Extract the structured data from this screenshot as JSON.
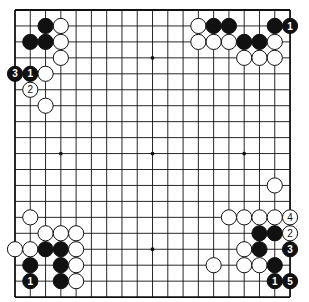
{
  "board": {
    "size": 19,
    "origin_x": 15,
    "origin_y": 10,
    "step_x": 15.28,
    "step_y": 15.95,
    "stone_radius": 7.6,
    "hoshi": [
      [
        9,
        3
      ],
      [
        3,
        9
      ],
      [
        9,
        9
      ],
      [
        15,
        9
      ],
      [
        9,
        15
      ]
    ],
    "colors": {
      "black": "#111111",
      "white": "#ffffff",
      "line": "#111111"
    }
  },
  "stones": [
    {
      "c": 2,
      "r": 1,
      "color": "black"
    },
    {
      "c": 3,
      "r": 1,
      "color": "white"
    },
    {
      "c": 1,
      "r": 2,
      "color": "black"
    },
    {
      "c": 2,
      "r": 2,
      "color": "black"
    },
    {
      "c": 3,
      "r": 2,
      "color": "white"
    },
    {
      "c": 3,
      "r": 3,
      "color": "white"
    },
    {
      "c": 0,
      "r": 4,
      "color": "black",
      "label": "3"
    },
    {
      "c": 1,
      "r": 4,
      "color": "black",
      "label": "1"
    },
    {
      "c": 2,
      "r": 4,
      "color": "white"
    },
    {
      "c": 1,
      "r": 5,
      "color": "white",
      "label": "2"
    },
    {
      "c": 2,
      "r": 6,
      "color": "white"
    },
    {
      "c": 12,
      "r": 1,
      "color": "white"
    },
    {
      "c": 13,
      "r": 1,
      "color": "black"
    },
    {
      "c": 14,
      "r": 1,
      "color": "black"
    },
    {
      "c": 17,
      "r": 1,
      "color": "black"
    },
    {
      "c": 18,
      "r": 1,
      "color": "black",
      "label": "1"
    },
    {
      "c": 12,
      "r": 2,
      "color": "white"
    },
    {
      "c": 13,
      "r": 2,
      "color": "white"
    },
    {
      "c": 14,
      "r": 2,
      "color": "white"
    },
    {
      "c": 15,
      "r": 2,
      "color": "black"
    },
    {
      "c": 16,
      "r": 2,
      "color": "black"
    },
    {
      "c": 17,
      "r": 2,
      "color": "white"
    },
    {
      "c": 15,
      "r": 3,
      "color": "white"
    },
    {
      "c": 16,
      "r": 3,
      "color": "white"
    },
    {
      "c": 17,
      "r": 3,
      "color": "white"
    },
    {
      "c": 17,
      "r": 11,
      "color": "white"
    },
    {
      "c": 14,
      "r": 13,
      "color": "white"
    },
    {
      "c": 15,
      "r": 13,
      "color": "white"
    },
    {
      "c": 16,
      "r": 13,
      "color": "white"
    },
    {
      "c": 17,
      "r": 13,
      "color": "white"
    },
    {
      "c": 18,
      "r": 13,
      "color": "white",
      "label": "4"
    },
    {
      "c": 16,
      "r": 14,
      "color": "black"
    },
    {
      "c": 17,
      "r": 14,
      "color": "black"
    },
    {
      "c": 18,
      "r": 14,
      "color": "white",
      "label": "2"
    },
    {
      "c": 15,
      "r": 15,
      "color": "white"
    },
    {
      "c": 16,
      "r": 15,
      "color": "black"
    },
    {
      "c": 18,
      "r": 15,
      "color": "black",
      "label": "3"
    },
    {
      "c": 13,
      "r": 16,
      "color": "white"
    },
    {
      "c": 15,
      "r": 16,
      "color": "white"
    },
    {
      "c": 16,
      "r": 16,
      "color": "white"
    },
    {
      "c": 17,
      "r": 16,
      "color": "black"
    },
    {
      "c": 17,
      "r": 17,
      "color": "black",
      "label": "1"
    },
    {
      "c": 18,
      "r": 17,
      "color": "black",
      "label": "5"
    },
    {
      "c": 1,
      "r": 13,
      "color": "white"
    },
    {
      "c": 2,
      "r": 14,
      "color": "white"
    },
    {
      "c": 3,
      "r": 14,
      "color": "white"
    },
    {
      "c": 4,
      "r": 14,
      "color": "white"
    },
    {
      "c": 0,
      "r": 15,
      "color": "white"
    },
    {
      "c": 1,
      "r": 15,
      "color": "white"
    },
    {
      "c": 2,
      "r": 15,
      "color": "black"
    },
    {
      "c": 3,
      "r": 15,
      "color": "black"
    },
    {
      "c": 4,
      "r": 15,
      "color": "white"
    },
    {
      "c": 1,
      "r": 16,
      "color": "black"
    },
    {
      "c": 3,
      "r": 16,
      "color": "black"
    },
    {
      "c": 4,
      "r": 16,
      "color": "white"
    },
    {
      "c": 1,
      "r": 17,
      "color": "black",
      "label": "1"
    },
    {
      "c": 3,
      "r": 17,
      "color": "black"
    },
    {
      "c": 4,
      "r": 17,
      "color": "white"
    }
  ]
}
